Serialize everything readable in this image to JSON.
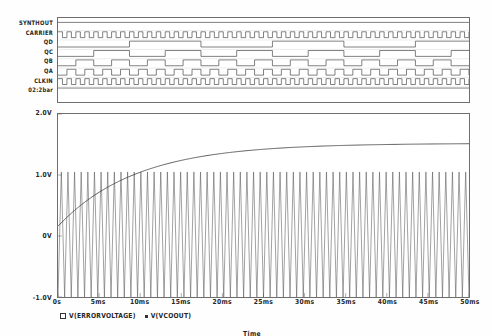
{
  "app": {
    "kind": "spice-waveform-viewer"
  },
  "digital": {
    "signals": [
      {
        "label": "SYNTHOUT",
        "kind": "flat-high"
      },
      {
        "label": "CARRIER",
        "kind": "clock",
        "periods": 46
      },
      {
        "label": "QD",
        "kind": "counter",
        "divide": 16
      },
      {
        "label": "QC",
        "kind": "counter",
        "divide": 8
      },
      {
        "label": "QB",
        "kind": "counter",
        "divide": 4
      },
      {
        "label": "QA",
        "kind": "counter",
        "divide": 2
      },
      {
        "label": "CLKIN",
        "kind": "clock",
        "periods": 46
      },
      {
        "label": "02:2bar",
        "kind": "flat-high"
      }
    ]
  },
  "chart_data": {
    "type": "line",
    "title": "",
    "xlabel": "Time",
    "ylabel": "",
    "xlim": [
      0,
      50
    ],
    "ylim": [
      -1.0,
      2.0
    ],
    "x_unit": "ms",
    "grid": false,
    "legend_position": "bottom-left",
    "xticks": [
      "0s",
      "5ms",
      "10ms",
      "15ms",
      "20ms",
      "25ms",
      "30ms",
      "35ms",
      "40ms",
      "45ms",
      "50ms"
    ],
    "xtick_values": [
      0,
      5,
      10,
      15,
      20,
      25,
      30,
      35,
      40,
      45,
      50
    ],
    "yticks": [
      "2.0V",
      "1.0V",
      "0V",
      "-1.0V"
    ],
    "ytick_values": [
      2.0,
      1.0,
      0.0,
      -1.0
    ],
    "series": [
      {
        "name": "V(ERRORVOLTAGE)",
        "marker": "square",
        "color": "#3a3a3a",
        "description": "exponential settling from 0.16V to ~1.52V",
        "start_value": 0.16,
        "final_value": 1.52,
        "time_constant_ms": 9.5,
        "x": [
          0,
          1,
          2,
          3,
          4,
          5,
          6,
          8,
          10,
          12,
          14,
          16,
          18,
          20,
          24,
          28,
          32,
          36,
          40,
          45,
          50
        ],
        "y": [
          0.16,
          0.32,
          0.46,
          0.58,
          0.68,
          0.77,
          0.85,
          0.98,
          1.08,
          1.16,
          1.23,
          1.28,
          1.32,
          1.36,
          1.41,
          1.44,
          1.47,
          1.48,
          1.49,
          1.51,
          1.52
        ]
      },
      {
        "name": "V(VCOOUT)",
        "marker": "dot",
        "color": "#555555",
        "description": "triangular VCO oscillation, constant amplitude",
        "amplitude_min": -1.0,
        "amplitude_max": 1.05,
        "cycles": 62,
        "waveform": "triangle"
      }
    ]
  },
  "legend": {
    "entries": [
      {
        "marker": "square",
        "text": "V(ERRORVOLTAGE)"
      },
      {
        "marker": "dot",
        "text": "V(VCOOUT)"
      }
    ]
  },
  "axis_title": "Time"
}
